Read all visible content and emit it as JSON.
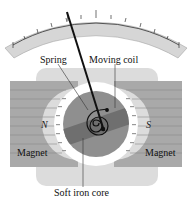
{
  "diagram": {
    "labels": {
      "spring": "Spring",
      "moving_coil": "Moving coil",
      "north_pole": "N",
      "south_pole": "S",
      "magnet_left": "Magnet",
      "magnet_right": "Magnet",
      "core": "Soft iron core"
    },
    "scale": {
      "tick_count": 15,
      "major_ticks": 5
    },
    "colors": {
      "scale_band": "#d6d6d6",
      "scale_border": "#9a9a9a",
      "magnet": "#a9a9a9",
      "magnet_lines": "#8a8a8a",
      "yoke": "#dcdcdc",
      "pole_ring": "#ffffff",
      "core": "#8f8f8f",
      "coil_band": "#6f6f6f",
      "needle": "#111111"
    }
  }
}
